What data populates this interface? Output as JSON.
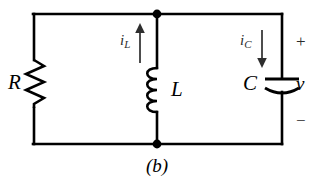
{
  "figure": {
    "caption": "(b)",
    "background_color": "#ffffff",
    "wire_color": "#000000",
    "arrow_color": "#2e2e2e"
  },
  "components": {
    "resistor": {
      "label": "R",
      "icon": "resistor-zigzag-icon",
      "branch": "left"
    },
    "inductor": {
      "label": "L",
      "icon": "inductor-coil-icon",
      "branch": "middle",
      "coil_loops": 4
    },
    "capacitor": {
      "label": "C",
      "icon": "capacitor-curved-plate-icon",
      "branch": "right"
    }
  },
  "currents": {
    "inductor_current": {
      "symbol": "i",
      "subscript": "L",
      "direction": "up",
      "icon": "arrow-up-icon"
    },
    "capacitor_current": {
      "symbol": "i",
      "subscript": "C",
      "direction": "down",
      "icon": "arrow-down-icon"
    }
  },
  "voltage": {
    "plus_sign": "+",
    "symbol": "v",
    "minus_sign": "−"
  },
  "nodes": {
    "top_junction": "node-dot",
    "bottom_junction": "node-dot"
  }
}
